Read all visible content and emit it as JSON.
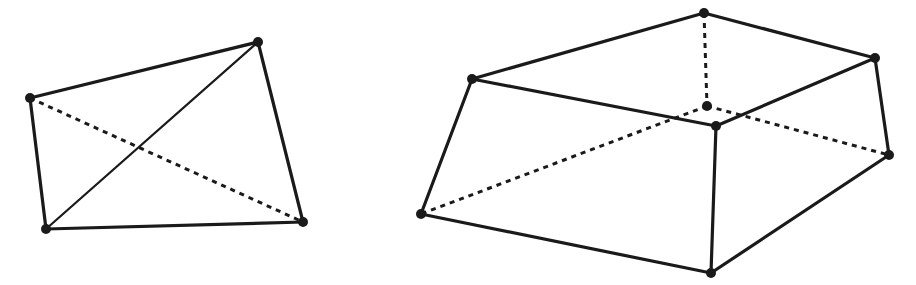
{
  "figures": [
    {
      "name": "tetrahedron",
      "vertices": {
        "A": [
          30,
          98
        ],
        "B": [
          258,
          42
        ],
        "C": [
          303,
          222
        ],
        "D": [
          46,
          229
        ]
      },
      "solid_edges": [
        [
          "A",
          "B"
        ],
        [
          "B",
          "C"
        ],
        [
          "C",
          "D"
        ],
        [
          "D",
          "A"
        ]
      ],
      "thin_edges": [
        [
          "D",
          "B"
        ]
      ],
      "dashed_edges": [
        [
          "A",
          "C"
        ]
      ]
    },
    {
      "name": "frustum",
      "vertices": {
        "T": [
          704,
          13
        ],
        "L": [
          472,
          79
        ],
        "R": [
          875,
          58
        ],
        "M": [
          707,
          106
        ],
        "F": [
          716,
          126
        ],
        "RB": [
          889,
          155
        ],
        "LB": [
          421,
          214
        ],
        "B": [
          711,
          273
        ]
      },
      "solid_edges": [
        [
          "L",
          "T"
        ],
        [
          "T",
          "R"
        ],
        [
          "L",
          "F"
        ],
        [
          "F",
          "R"
        ],
        [
          "L",
          "LB"
        ],
        [
          "LB",
          "B"
        ],
        [
          "F",
          "B"
        ],
        [
          "B",
          "RB"
        ],
        [
          "R",
          "RB"
        ]
      ],
      "thin_edges": [],
      "dashed_edges": [
        [
          "T",
          "M"
        ],
        [
          "M",
          "LB"
        ],
        [
          "M",
          "RB"
        ]
      ]
    }
  ],
  "colors": {
    "stroke": "#1a1a1a",
    "background": "#ffffff"
  }
}
